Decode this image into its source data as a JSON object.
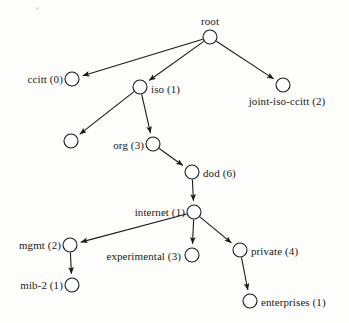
{
  "diagram": {
    "title": "root",
    "type": "oid-object-identifier-tree",
    "background_color": "#fdfdfc",
    "stroke_color": "#1a1a1a",
    "node_fill": "#ffffff",
    "node_radius": 7,
    "nodes": [
      {
        "id": "root",
        "label": "root",
        "cx": 210,
        "cy": 37,
        "label_x": 210,
        "label_y": 27,
        "label_pos": "above"
      },
      {
        "id": "ccitt",
        "label": "ccitt (0)",
        "cx": 72,
        "cy": 79,
        "label_x": 63,
        "label_y": 79,
        "label_pos": "left"
      },
      {
        "id": "iso",
        "label": "iso (1)",
        "cx": 140,
        "cy": 87,
        "label_x": 151,
        "label_y": 89,
        "label_pos": "right"
      },
      {
        "id": "joint-iso-ccitt",
        "label": "joint-iso-ccitt (2)",
        "cx": 283,
        "cy": 85,
        "label_x": 287,
        "label_y": 96,
        "label_pos": "below"
      },
      {
        "id": "iso-unlabeled",
        "label": "",
        "cx": 71,
        "cy": 141,
        "label_x": 62,
        "label_y": 141,
        "label_pos": "left"
      },
      {
        "id": "org",
        "label": "org (3)",
        "cx": 153,
        "cy": 144,
        "label_x": 144,
        "label_y": 145,
        "label_pos": "left"
      },
      {
        "id": "dod",
        "label": "dod (6)",
        "cx": 192,
        "cy": 172,
        "label_x": 203,
        "label_y": 173,
        "label_pos": "right"
      },
      {
        "id": "internet",
        "label": "internet (1)",
        "cx": 194,
        "cy": 212,
        "label_x": 185,
        "label_y": 212,
        "label_pos": "left"
      },
      {
        "id": "mgmt",
        "label": "mgmt (2)",
        "cx": 70,
        "cy": 245,
        "label_x": 61,
        "label_y": 245,
        "label_pos": "left"
      },
      {
        "id": "experimental",
        "label": "experimental (3)",
        "cx": 192,
        "cy": 255,
        "label_x": 181,
        "label_y": 256,
        "label_pos": "left"
      },
      {
        "id": "private",
        "label": "private (4)",
        "cx": 240,
        "cy": 250,
        "label_x": 251,
        "label_y": 251,
        "label_pos": "right"
      },
      {
        "id": "mib-2",
        "label": "mib-2 (1)",
        "cx": 72,
        "cy": 285,
        "label_x": 63,
        "label_y": 285,
        "label_pos": "left"
      },
      {
        "id": "enterprises",
        "label": "enterprises (1)",
        "cx": 250,
        "cy": 301,
        "label_x": 261,
        "label_y": 302,
        "label_pos": "right"
      }
    ],
    "edges": [
      {
        "from": "root",
        "to": "ccitt"
      },
      {
        "from": "root",
        "to": "iso"
      },
      {
        "from": "root",
        "to": "joint-iso-ccitt"
      },
      {
        "from": "iso",
        "to": "iso-unlabeled"
      },
      {
        "from": "iso",
        "to": "org"
      },
      {
        "from": "org",
        "to": "dod"
      },
      {
        "from": "dod",
        "to": "internet"
      },
      {
        "from": "internet",
        "to": "mgmt"
      },
      {
        "from": "internet",
        "to": "experimental"
      },
      {
        "from": "internet",
        "to": "private"
      },
      {
        "from": "mgmt",
        "to": "mib-2"
      },
      {
        "from": "private",
        "to": "enterprises"
      }
    ],
    "specks": [
      {
        "x": 36,
        "y": 7
      }
    ]
  }
}
